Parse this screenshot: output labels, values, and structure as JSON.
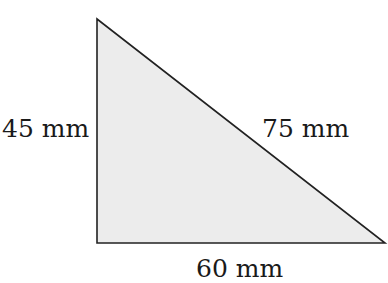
{
  "diagram": {
    "shape": "right-triangle",
    "fill_color": "#ececec",
    "stroke_color": "#222222",
    "vertices": [
      [
        97,
        19
      ],
      [
        97,
        243
      ],
      [
        385,
        243
      ]
    ],
    "labels": {
      "left_side": "45 mm",
      "hypotenuse": "75 mm",
      "bottom_side": "60 mm"
    }
  }
}
